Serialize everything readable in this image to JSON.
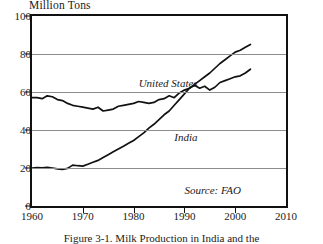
{
  "chart_data": {
    "type": "line",
    "title": "",
    "ylabel": "Million Tons",
    "xlabel": "",
    "xlim": [
      1960,
      2010
    ],
    "ylim": [
      0,
      100
    ],
    "xticks": [
      1960,
      1970,
      1980,
      1990,
      2000,
      2010
    ],
    "yticks": [
      0,
      20,
      40,
      60,
      80,
      100
    ],
    "grid": "horizontal",
    "legend_position": "inline",
    "annotations": [
      "Source: FAO"
    ],
    "series": [
      {
        "name": "United States",
        "label_x": 1981,
        "label_y": 64,
        "x": [
          1960,
          1961,
          1962,
          1963,
          1964,
          1965,
          1966,
          1967,
          1968,
          1969,
          1970,
          1971,
          1972,
          1973,
          1974,
          1975,
          1976,
          1977,
          1978,
          1979,
          1980,
          1981,
          1982,
          1983,
          1984,
          1985,
          1986,
          1987,
          1988,
          1989,
          1990,
          1991,
          1992,
          1993,
          1994,
          1995,
          1996,
          1997,
          1998,
          1999,
          2000,
          2001,
          2002,
          2003
        ],
        "y": [
          57,
          57,
          56.5,
          58,
          57.5,
          56,
          55.5,
          54,
          53,
          52.5,
          52,
          51.5,
          51,
          52,
          50,
          50.5,
          51,
          52.5,
          53,
          53.5,
          54,
          55,
          54.5,
          54,
          54.5,
          56,
          56.5,
          58,
          57,
          59.5,
          61,
          62,
          63.5,
          62,
          63,
          61,
          62.5,
          65,
          66,
          67,
          68,
          68.5,
          70,
          72
        ]
      },
      {
        "name": "India",
        "label_x": 1988,
        "label_y": 36,
        "x": [
          1960,
          1961,
          1962,
          1963,
          1964,
          1965,
          1966,
          1967,
          1968,
          1969,
          1970,
          1971,
          1972,
          1973,
          1974,
          1975,
          1976,
          1977,
          1978,
          1979,
          1980,
          1981,
          1982,
          1983,
          1984,
          1985,
          1986,
          1987,
          1988,
          1989,
          1990,
          1991,
          1992,
          1993,
          1994,
          1995,
          1996,
          1997,
          1998,
          1999,
          2000,
          2001,
          2002,
          2003
        ],
        "y": [
          20,
          20.2,
          20.1,
          20.3,
          20,
          19.5,
          19.2,
          19.8,
          21.5,
          21.2,
          21,
          22,
          23,
          24,
          25.5,
          27,
          28.5,
          30,
          31.5,
          33,
          34.5,
          36.5,
          38.5,
          41,
          43,
          45.5,
          48,
          50,
          53,
          56,
          59,
          62,
          64,
          66,
          68,
          70,
          72.5,
          75,
          77,
          79,
          81,
          82,
          83.5,
          85
        ]
      }
    ]
  },
  "figure": {
    "source_note": "Source: FAO",
    "caption": "Figure 3-1. Milk Production in India and the"
  }
}
